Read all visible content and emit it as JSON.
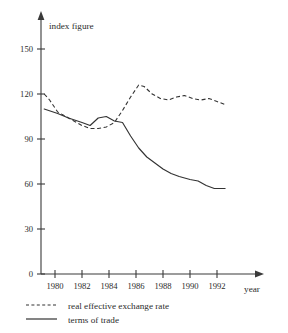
{
  "chart_data": {
    "type": "line",
    "title": "",
    "xlabel": "year",
    "ylabel": "index figure",
    "xlim": [
      1978.8,
      1993.2
    ],
    "ylim": [
      0,
      158
    ],
    "grid": false,
    "legend_position": "below-left",
    "y_ticks": [
      "0",
      "30",
      "60",
      "90",
      "120",
      "150"
    ],
    "y_tick_values": [
      0,
      30,
      60,
      90,
      120,
      150
    ],
    "x_ticks": [
      "1980",
      "1982",
      "1984",
      "1986",
      "1988",
      "1990",
      "1992"
    ],
    "x_tick_values": [
      1980,
      1982,
      1984,
      1986,
      1988,
      1990,
      1992
    ],
    "series": [
      {
        "name": "real effective exchange rate",
        "style": "dashed",
        "x": [
          1979.2,
          1979.6,
          1980.2,
          1981.0,
          1982.0,
          1982.6,
          1983.2,
          1983.8,
          1984.4,
          1985.0,
          1985.6,
          1986.2,
          1986.6,
          1987.2,
          1987.8,
          1988.4,
          1989.0,
          1989.6,
          1990.2,
          1990.8,
          1991.4,
          1992.0,
          1992.6
        ],
        "values": [
          120,
          116,
          108,
          104,
          99,
          97,
          97,
          98,
          101,
          109,
          118,
          126,
          125,
          120,
          117,
          116,
          118,
          119,
          117,
          116,
          117,
          115,
          113
        ]
      },
      {
        "name": "terms of trade",
        "style": "solid",
        "x": [
          1979.2,
          1980.2,
          1981.0,
          1982.0,
          1982.6,
          1983.2,
          1983.8,
          1984.4,
          1985.0,
          1985.6,
          1986.2,
          1986.8,
          1987.4,
          1988.0,
          1988.6,
          1989.2,
          1990.0,
          1990.6,
          1991.2,
          1991.8,
          1992.6
        ],
        "values": [
          110,
          107,
          104,
          101,
          99,
          104,
          105,
          102,
          101,
          92,
          84,
          78,
          74,
          70,
          67,
          65,
          63,
          62,
          59,
          57,
          57
        ]
      }
    ]
  },
  "legend": {
    "items": [
      {
        "label": "real effective exchange rate",
        "style": "dashed"
      },
      {
        "label": "terms of trade",
        "style": "solid"
      }
    ]
  },
  "axes": {
    "y_title": "index figure",
    "x_title": "year"
  }
}
